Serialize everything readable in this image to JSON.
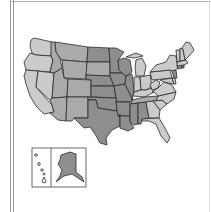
{
  "map": {
    "subject": "United States choropleth map",
    "shade_levels": {
      "light": "#cbcbcb",
      "medium": "#aaaaaa",
      "dark": "#8e8e8e",
      "none": "#ffffff"
    },
    "states": {
      "WA": "light",
      "OR": "light",
      "CA": "light",
      "NV": "light",
      "ID": "medium",
      "MT": "medium",
      "WY": "medium",
      "UT": "medium",
      "CO": "medium",
      "AZ": "medium",
      "NM": "medium",
      "ND": "dark",
      "SD": "medium",
      "NE": "dark",
      "KS": "dark",
      "OK": "dark",
      "TX": "dark",
      "MN": "dark",
      "IA": "dark",
      "MO": "dark",
      "AR": "dark",
      "LA": "dark",
      "WI": "dark",
      "IL": "dark",
      "MS": "dark",
      "AL": "dark",
      "MI": "light",
      "IN": "light",
      "OH": "light",
      "KY": "light",
      "TN": "medium",
      "GA": "light",
      "FL": "light",
      "SC": "light",
      "NC": "light",
      "VA": "light",
      "WV": "light",
      "PA": "light",
      "NY": "light",
      "ME": "light",
      "NH": "light",
      "VT": "light",
      "MA": "light",
      "RI": "dark",
      "CT": "dark",
      "NJ": "dark",
      "DE": "light",
      "MD": "light",
      "AK": "dark",
      "HI": "none"
    }
  }
}
